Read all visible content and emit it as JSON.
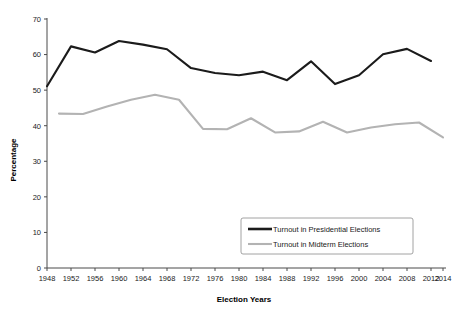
{
  "chart_data": {
    "type": "line",
    "title": "",
    "xlabel": "Election Years",
    "ylabel": "Percentage",
    "xlim": [
      1948,
      2014
    ],
    "ylim": [
      0,
      70
    ],
    "ytick_step": 10,
    "xtick_step": 4,
    "grid": false,
    "legend_position": "bottom-right",
    "yticks": [
      "0",
      "10",
      "20",
      "30",
      "40",
      "50",
      "60",
      "70"
    ],
    "xticks": [
      "1948",
      "1952",
      "1956",
      "1960",
      "1964",
      "1968",
      "1972",
      "1976",
      "1980",
      "1984",
      "1988",
      "1992",
      "1996",
      "2000",
      "2004",
      "2008",
      "2012",
      "2014"
    ],
    "series": [
      {
        "name": "Turnout in Presidential Elections",
        "color": "#1b1b1b",
        "x": [
          1948,
          1952,
          1956,
          1960,
          1964,
          1968,
          1972,
          1976,
          1980,
          1984,
          1988,
          1992,
          1996,
          2000,
          2004,
          2008,
          2012
        ],
        "values": [
          51.1,
          62.3,
          60.6,
          63.8,
          62.8,
          61.5,
          56.2,
          54.8,
          54.2,
          55.2,
          52.8,
          58.1,
          51.7,
          54.2,
          60.1,
          61.6,
          58.2
        ]
      },
      {
        "name": "Turnout in Midterm Elections",
        "color": "#b3b3b3",
        "x": [
          1950,
          1954,
          1958,
          1962,
          1966,
          1970,
          1974,
          1978,
          1982,
          1986,
          1990,
          1994,
          1998,
          2002,
          2006,
          2010,
          2014
        ],
        "values": [
          43.4,
          43.3,
          45.4,
          47.3,
          48.7,
          47.3,
          39.1,
          39.0,
          42.1,
          38.1,
          38.4,
          41.1,
          38.1,
          39.5,
          40.4,
          40.9,
          36.7
        ]
      }
    ]
  },
  "legend": {
    "items": [
      {
        "label": "Turnout in Presidential Elections",
        "color": "#1b1b1b"
      },
      {
        "label": "Turnout in Midterm Elections",
        "color": "#b3b3b3"
      }
    ]
  }
}
